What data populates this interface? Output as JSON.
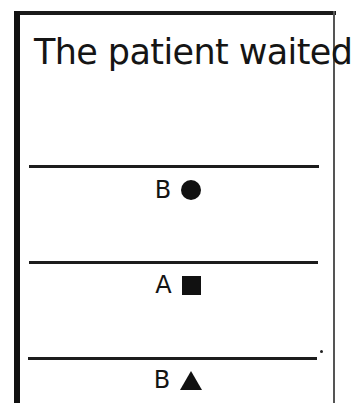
{
  "card": {
    "sentence_fragment": "The patient waited",
    "options": [
      {
        "label": "B",
        "shape": "circle",
        "shape_icon": "filled-circle-icon",
        "glyph": "●"
      },
      {
        "label": "A",
        "shape": "square",
        "shape_icon": "filled-square-icon",
        "glyph": "■"
      },
      {
        "label": "B",
        "shape": "triangle",
        "shape_icon": "filled-triangle-icon",
        "glyph": "▲"
      }
    ],
    "colors": {
      "ink": "#111111",
      "background": "#ffffff"
    }
  }
}
